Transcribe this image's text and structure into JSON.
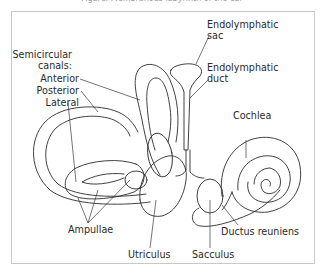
{
  "caption": {
    "text": "Figure: Membranous labyrinth of the ear"
  },
  "diagram": {
    "stroke_color": "#2b2b2b",
    "frame_color": "#c8c8c8",
    "labels": {
      "semicircular_canals_line1": "Semicircular",
      "semicircular_canals_line2": "canals:",
      "anterior": "Anterior",
      "posterior": "Posterior",
      "lateral": "Lateral",
      "endolymphatic_sac_line1": "Endolymphatic",
      "endolymphatic_sac_line2": "sac",
      "endolymphatic_duct_line1": "Endolymphatic",
      "endolymphatic_duct_line2": "duct",
      "cochlea": "Cochlea",
      "ampullae": "Ampullae",
      "utriculus": "Utriculus",
      "sacculus": "Sacculus",
      "ductus_reuniens": "Ductus reuniens"
    }
  }
}
